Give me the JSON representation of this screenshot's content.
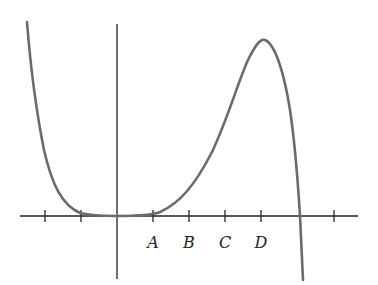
{
  "diagram": {
    "type": "function-graph",
    "x_axis": {
      "labels": [
        {
          "text": "A",
          "tick_index": 1
        },
        {
          "text": "B",
          "tick_index": 2
        },
        {
          "text": "C",
          "tick_index": 3
        },
        {
          "text": "D",
          "tick_index": 4
        }
      ],
      "tick_positions": [
        -2,
        -1,
        1,
        2,
        3,
        4,
        6
      ]
    },
    "curve": {
      "color": "#6b6b6b",
      "features": [
        "decreasing from upper left",
        "flat tangent at origin",
        "local max at D",
        "root between D and next tick",
        "decreasing to lower right"
      ]
    },
    "colors": {
      "axis": "#222222",
      "curve": "#6b6b6b",
      "background": "#ffffff"
    }
  }
}
